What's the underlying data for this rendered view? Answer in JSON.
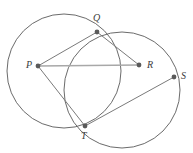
{
  "figure": {
    "width": 193,
    "height": 153,
    "background": "#ffffff",
    "stroke_color": "#6b6b6b",
    "chord_color": "#9a9a9a",
    "point_color": "#5a5a5a",
    "label_color": "#3c3c3c"
  },
  "points": [
    {
      "id": "P",
      "label": "P",
      "x": 38,
      "y": 66,
      "label_x": 26,
      "label_y": 60
    },
    {
      "id": "Q",
      "label": "Q",
      "x": 97,
      "y": 32,
      "label_x": 93,
      "label_y": 13
    },
    {
      "id": "R",
      "label": "R",
      "x": 139,
      "y": 65,
      "label_x": 147,
      "label_y": 60
    },
    {
      "id": "S",
      "label": "S",
      "x": 174,
      "y": 77,
      "label_x": 181,
      "label_y": 71
    },
    {
      "id": "T",
      "label": "T",
      "x": 85,
      "y": 126,
      "label_x": 81,
      "label_y": 131
    }
  ],
  "circles": [
    {
      "id": "left-circle",
      "cx": 64,
      "cy": 71,
      "r": 57
    },
    {
      "id": "right-circle",
      "cx": 122,
      "cy": 90,
      "r": 58
    }
  ],
  "segments": [
    {
      "id": "PQ",
      "from": "P",
      "to": "Q",
      "x1": 38,
      "y1": 66,
      "x2": 97,
      "y2": 32,
      "style": "dark"
    },
    {
      "id": "QR",
      "from": "Q",
      "to": "R",
      "x1": 97,
      "y1": 32,
      "x2": 139,
      "y2": 65,
      "style": "dark"
    },
    {
      "id": "PR",
      "from": "P",
      "to": "R",
      "x1": 38,
      "y1": 66,
      "x2": 139,
      "y2": 65,
      "style": "light"
    },
    {
      "id": "PT",
      "from": "P",
      "to": "T",
      "x1": 38,
      "y1": 66,
      "x2": 85,
      "y2": 126,
      "style": "dark"
    },
    {
      "id": "TS",
      "from": "T",
      "to": "S",
      "x1": 85,
      "y1": 126,
      "x2": 174,
      "y2": 77,
      "style": "dark"
    }
  ],
  "point_radius": 2.2,
  "stroke_width": 1
}
